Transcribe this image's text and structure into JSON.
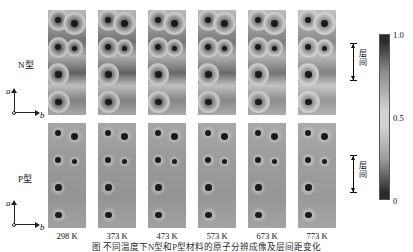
{
  "figure": {
    "caption": "图  不同温度下N型和P型材料的原子分辨成像及层间距变化",
    "rows": [
      {
        "id": "n-type",
        "label": "N型"
      },
      {
        "id": "p-type",
        "label": "P型"
      }
    ],
    "axis_indicator": {
      "vertical_label": "a",
      "horizontal_label": "b"
    },
    "temperatures": [
      "298 K",
      "373 K",
      "473 K",
      "573 K",
      "673 K",
      "773 K"
    ],
    "annotation": {
      "label": "层间",
      "char_1": "层",
      "char_2": "间"
    }
  },
  "colorbar": {
    "ticks": [
      "1.0",
      "0.5",
      "0"
    ],
    "gradient_top": "#2b2b2b",
    "gradient_mid": "#d2d2d2",
    "gradient_bottom": "#2b2b2b",
    "orientation": "vertical"
  },
  "chart_data": {
    "type": "heatmap",
    "title": "不同温度下N型和P型材料的原子分辨成像",
    "xlabel": "b",
    "ylabel": "a",
    "grid": false,
    "legend": "colorbar-right",
    "colormap": "grayscale",
    "value_range": [
      0,
      1
    ],
    "colorbar_ticks": [
      0,
      0.5,
      1.0
    ],
    "categories": [
      "298 K",
      "373 K",
      "473 K",
      "573 K",
      "673 K",
      "773 K"
    ],
    "series": [
      {
        "name": "N型",
        "panels": [
          {
            "temperature": "298 K",
            "base_intensity": 0.62,
            "spot_count": 6,
            "interlayer_contrast": 0.8,
            "note": "强层间衬度，原子柱周围明显暗晕"
          },
          {
            "temperature": "373 K",
            "base_intensity": 0.62,
            "spot_count": 6,
            "interlayer_contrast": 0.78,
            "note": "层间衬度略减弱"
          },
          {
            "temperature": "473 K",
            "base_intensity": 0.63,
            "spot_count": 6,
            "interlayer_contrast": 0.74,
            "note": "暗晕范围收缩"
          },
          {
            "temperature": "573 K",
            "base_intensity": 0.63,
            "spot_count": 6,
            "interlayer_contrast": 0.7,
            "note": "衬度进一步减弱"
          },
          {
            "temperature": "673 K",
            "base_intensity": 0.64,
            "spot_count": 6,
            "interlayer_contrast": 0.62,
            "note": "层间衬度明显降低"
          },
          {
            "temperature": "773 K",
            "base_intensity": 0.66,
            "spot_count": 6,
            "interlayer_contrast": 0.5,
            "note": "层间距增大，结构畸变"
          }
        ]
      },
      {
        "name": "P型",
        "panels": [
          {
            "temperature": "298 K",
            "base_intensity": 0.6,
            "spot_count": 6,
            "interlayer_contrast": 0.12,
            "note": "背景均匀，无明显层间衬度"
          },
          {
            "temperature": "373 K",
            "base_intensity": 0.6,
            "spot_count": 6,
            "interlayer_contrast": 0.12,
            "note": "背景均匀"
          },
          {
            "temperature": "473 K",
            "base_intensity": 0.6,
            "spot_count": 6,
            "interlayer_contrast": 0.13,
            "note": "背景均匀"
          },
          {
            "temperature": "573 K",
            "base_intensity": 0.61,
            "spot_count": 6,
            "interlayer_contrast": 0.14,
            "note": "背景均匀"
          },
          {
            "temperature": "673 K",
            "base_intensity": 0.61,
            "spot_count": 6,
            "interlayer_contrast": 0.16,
            "note": "出现轻微亮晕"
          },
          {
            "temperature": "773 K",
            "base_intensity": 0.62,
            "spot_count": 6,
            "interlayer_contrast": 0.3,
            "note": "原子柱周围出现同心亮环"
          }
        ]
      }
    ]
  },
  "layout": {
    "panel_width": 38,
    "panel_height": 105,
    "panel_gap": 12,
    "first_panel_x": 48,
    "n_row_y": 10,
    "p_row_y": 123
  }
}
